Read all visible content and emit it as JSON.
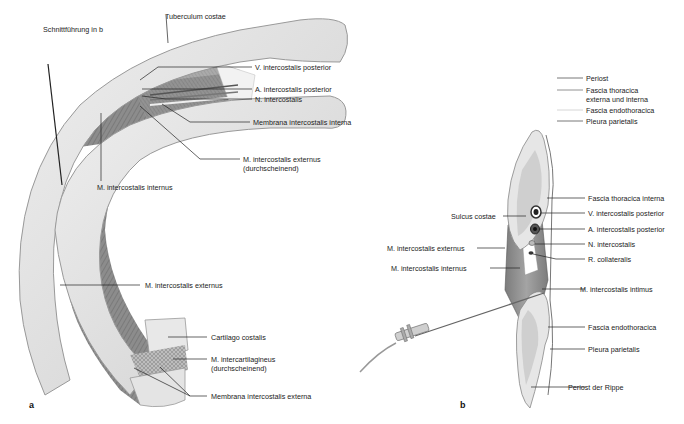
{
  "figure": {
    "panel_a": {
      "letter": "a",
      "labels": {
        "schnitt": "Schnittführung in b",
        "tuberculum": "Tuberculum costae",
        "v_intercostalis": "V. intercostalis posterior",
        "a_intercostalis": "A. intercostalis posterior",
        "n_intercostalis": "N. intercostalis",
        "membrana_interna": "Membrana intercostalis interna",
        "m_externus_1": "M. intercostalis externus",
        "m_externus_2": "(durchscheinend)",
        "m_internus": "M. intercostalis internus",
        "m_externus_lower": "M. intercostalis externus",
        "cartilago": "Cartilago costalis",
        "intercartilagineus_1": "M. intercartilagineus",
        "intercartilagineus_2": "(durchscheinend)",
        "membrana_externa": "Membrana intercostalis externa"
      }
    },
    "panel_b": {
      "letter": "b",
      "legend": [
        {
          "label": "Periost",
          "color": "#555555"
        },
        {
          "label": "Fascia thoracica",
          "label2": "externa und interna",
          "color": "#777777"
        },
        {
          "label": "Fascia endothoracica",
          "color": "#cccccc"
        },
        {
          "label": "Pleura parietalis",
          "color": "#555555"
        }
      ],
      "labels": {
        "fascia_thoracica_interna": "Fascia thoracica interna",
        "sulcus": "Sulcus costae",
        "v_intercostalis": "V. intercostalis posterior",
        "a_intercostalis": "A. intercostalis posterior",
        "m_externus": "M. intercostalis externus",
        "n_intercostalis": "N. intercostalis",
        "m_internus": "M. intercostalis internus",
        "r_collateralis": "R. collateralis",
        "m_intimus": "M. intercostalis intimus",
        "fascia_endothoracica": "Fascia endothoracica",
        "pleura": "Pleura parietalis",
        "periost": "Periost der Rippe"
      }
    }
  },
  "colors": {
    "bone": "#e4e4e4",
    "bone_edge": "#9a9a9a",
    "muscle": "#8e8e8e",
    "muscle_dark": "#6a6a6a",
    "leader": "#222222"
  }
}
